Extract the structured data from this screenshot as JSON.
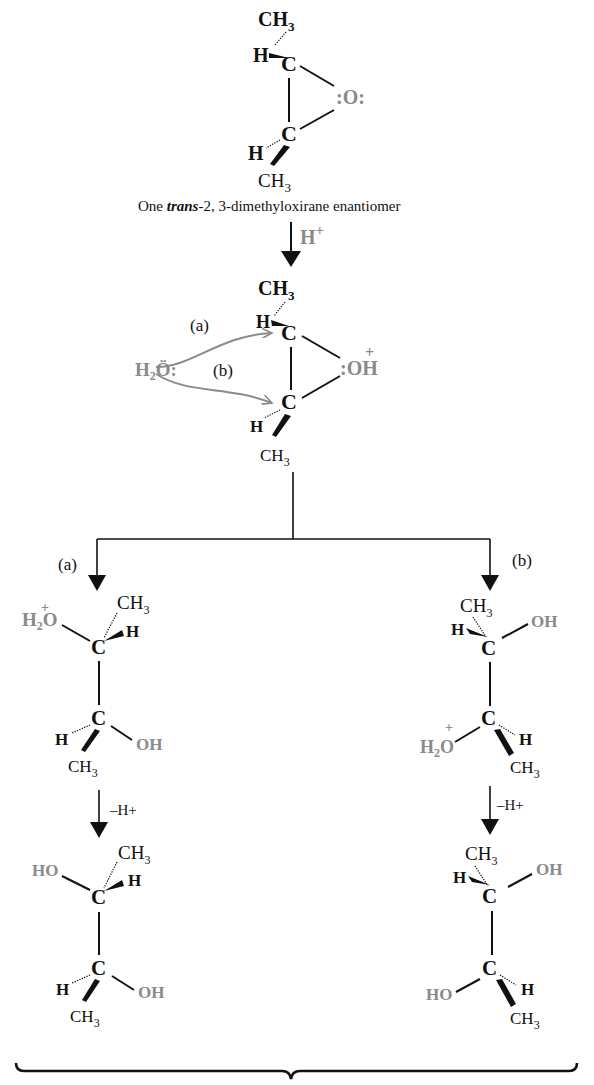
{
  "starting_material": {
    "caption_prefix": "One ",
    "caption_italic": "trans",
    "caption_suffix": "-2, 3-dimethyloxirane enantiomer",
    "top_group": "CH3",
    "bottom_group": "CH3",
    "oxygen": ":O:"
  },
  "step1": {
    "reagent": "H+"
  },
  "protonated_epoxide": {
    "top_group": "CH3",
    "bottom_group": "CH3",
    "oxygen": ":OH",
    "charge": "+",
    "nucleophile": "H2O:",
    "path_a_label": "(a)",
    "path_b_label": "(b)"
  },
  "branch_a": {
    "label": "(a)",
    "intermediate": {
      "upper_left": "H2O",
      "upper_charge": "+",
      "upper_right_top": "CH3",
      "upper_right": "H",
      "lower_left": "H",
      "lower_right": "OH",
      "lower_bottom": "CH3"
    },
    "deprotonation": "–H+",
    "product": {
      "upper_left": "HO",
      "upper_right_top": "CH3",
      "upper_right": "H",
      "lower_left": "H",
      "lower_right": "OH",
      "lower_bottom": "CH3"
    }
  },
  "branch_b": {
    "label": "(b)",
    "intermediate": {
      "upper_top": "CH3",
      "upper_left": "H",
      "upper_right": "OH",
      "lower_left": "H2O",
      "lower_charge": "+",
      "lower_right": "H",
      "lower_bottom": "CH3"
    },
    "deprotonation": "–H+",
    "product": {
      "upper_top": "CH3",
      "upper_left": "H",
      "upper_right": "OH",
      "lower_left": "HO",
      "lower_right": "H",
      "lower_bottom": "CH3"
    }
  },
  "colors": {
    "ink": "#111111",
    "highlight": "#8a8a8a"
  }
}
